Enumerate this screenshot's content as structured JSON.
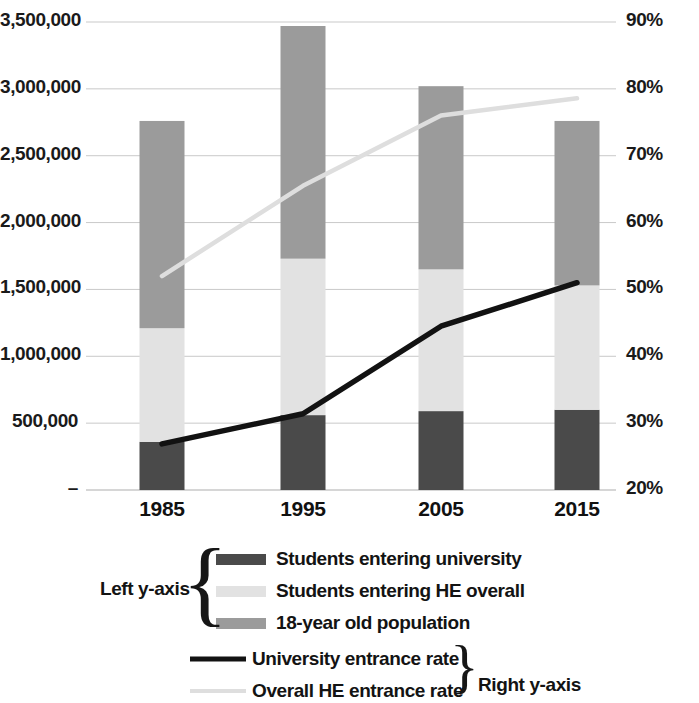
{
  "chart_data": {
    "type": "bar",
    "title": "",
    "subtitle": "",
    "xlabel": "",
    "ylabel": "",
    "y2label": "",
    "grid": true,
    "legend_position": "bottom",
    "categories": [
      "1985",
      "1995",
      "2005",
      "2015"
    ],
    "left_axis": {
      "label": "Left y-axis",
      "ticks": [
        "–",
        "500,000",
        "1,000,000",
        "1,500,000",
        "2,000,000",
        "2,500,000",
        "3,000,000",
        "3,500,000"
      ],
      "tick_values": [
        0,
        500000,
        1000000,
        1500000,
        2000000,
        2500000,
        3000000,
        3500000
      ],
      "ylim": [
        0,
        3500000
      ]
    },
    "right_axis": {
      "label": "Right y-axis",
      "ticks": [
        "20%",
        "30%",
        "40%",
        "50%",
        "60%",
        "70%",
        "80%",
        "90%"
      ],
      "tick_values": [
        20,
        30,
        40,
        50,
        60,
        70,
        80,
        90
      ],
      "ylim": [
        20,
        90
      ]
    },
    "series": [
      {
        "name": "Students entering university",
        "axis": "left",
        "kind": "bar-segment",
        "color": "#4a4a4a",
        "values": [
          360000,
          560000,
          590000,
          600000
        ]
      },
      {
        "name": "Students entering HE overall",
        "axis": "left",
        "kind": "bar-segment",
        "color": "#e2e2e2",
        "values": [
          1210000,
          1730000,
          1650000,
          1530000
        ]
      },
      {
        "name": "18-year old population",
        "axis": "left",
        "kind": "bar-total",
        "color": "#9b9b9b",
        "values": [
          2760000,
          3470000,
          3020000,
          2760000
        ]
      },
      {
        "name": "University entrance rate",
        "axis": "right",
        "kind": "line",
        "color": "#121212",
        "values": [
          26.9,
          31.4,
          44.5,
          51.0
        ]
      },
      {
        "name": "Overall HE entrance rate",
        "axis": "right",
        "kind": "line",
        "color": "#dedede",
        "values": [
          52.0,
          65.5,
          76.0,
          78.6
        ]
      }
    ],
    "legend": [
      {
        "label": "Students entering university",
        "swatch": "#4a4a4a",
        "style": "block"
      },
      {
        "label": "Students entering HE overall",
        "swatch": "#e2e2e2",
        "style": "block"
      },
      {
        "label": "18-year old population",
        "swatch": "#9b9b9b",
        "style": "block"
      },
      {
        "label": "University entrance rate",
        "swatch": "#121212",
        "style": "line"
      },
      {
        "label": "Overall HE entrance rate",
        "swatch": "#dedede",
        "style": "line"
      }
    ],
    "groupings": [
      {
        "label": "Left y-axis",
        "brace": "{",
        "members": [
          0,
          1,
          2
        ]
      },
      {
        "label": "Right y-axis",
        "brace": "}",
        "members": [
          3,
          4
        ]
      }
    ]
  },
  "colors": {
    "dark_gray": "#4a4a4a",
    "light_gray": "#e2e2e2",
    "mid_gray": "#9b9b9b",
    "line_dark": "#121212",
    "line_light": "#dedede",
    "gridline": "#c9c9c9",
    "text": "#131313",
    "background": "#ffffff"
  }
}
